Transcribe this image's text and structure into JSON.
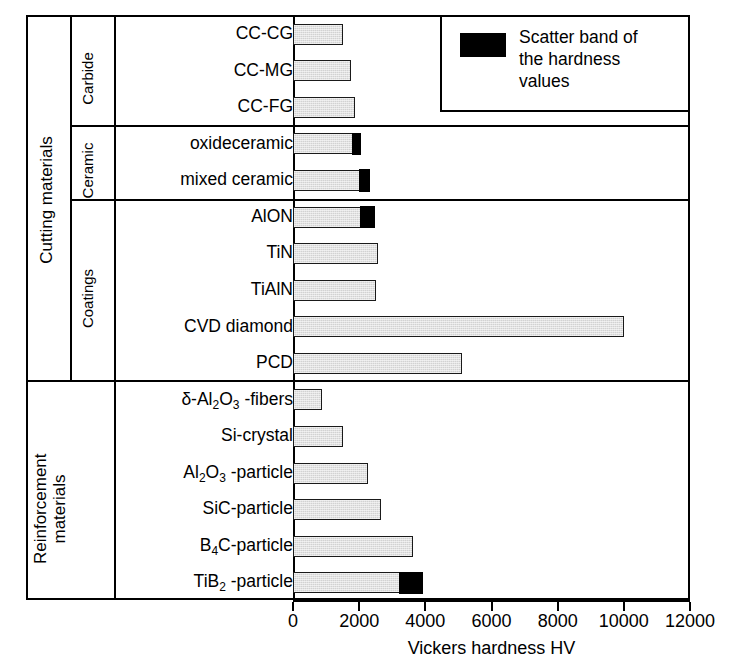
{
  "chart_data": {
    "type": "bar",
    "orientation": "horizontal",
    "title": "",
    "xlabel": "Vickers hardness HV",
    "ylabel": "",
    "xlim": [
      0,
      12000
    ],
    "xticks": [
      0,
      2000,
      4000,
      6000,
      8000,
      10000,
      12000
    ],
    "grid": false,
    "legend": {
      "position": "top-right",
      "entries": [
        {
          "label": "Scatter band of the hardness values",
          "color": "#000000",
          "swatch": "black-rectangle"
        }
      ]
    },
    "series_colors": {
      "value": "#d2d2d2",
      "scatter_band": "#000000"
    },
    "groups": [
      {
        "name": "Cutting materials",
        "subgroups": [
          {
            "name": "Carbide",
            "categories": [
              "CC-CG",
              "CC-MG",
              "CC-FG"
            ],
            "values": [
              1500,
              1740,
              1860
            ],
            "scatter_high": [
              1500,
              1740,
              1860
            ]
          },
          {
            "name": "Ceramic",
            "categories": [
              "oxideceramic",
              "mixed ceramic"
            ],
            "values": [
              1770,
              1980
            ],
            "scatter_high": [
              2040,
              2310
            ]
          },
          {
            "name": "Coatings",
            "categories": [
              "AlON",
              "TiN",
              "TiAlN",
              "CVD diamond",
              "PCD"
            ],
            "values": [
              2010,
              2580,
              2520,
              10020,
              5100
            ],
            "scatter_high": [
              2460,
              2580,
              2520,
              10020,
              5100
            ]
          }
        ]
      },
      {
        "name": "Reinforcement materials",
        "subgroups": [
          {
            "name": "",
            "categories": [
              "δ-Al2O3 -fibers",
              "Si-crystal",
              "Al2O3 -particle",
              "SiC-particle",
              "B4C-particle",
              "TiB2 -particle"
            ],
            "values": [
              870,
              1500,
              2280,
              2670,
              3630,
              3180
            ],
            "scatter_high": [
              870,
              1500,
              2280,
              2670,
              3630,
              3900
            ]
          }
        ]
      }
    ],
    "rows": [
      {
        "label_html": "CC-CG",
        "group": "Cutting materials",
        "subgroup": "Carbide",
        "value": 1500,
        "scatter_high": 1500
      },
      {
        "label_html": "CC-MG",
        "group": "Cutting materials",
        "subgroup": "Carbide",
        "value": 1740,
        "scatter_high": 1740
      },
      {
        "label_html": "CC-FG",
        "group": "Cutting materials",
        "subgroup": "Carbide",
        "value": 1860,
        "scatter_high": 1860
      },
      {
        "label_html": "oxideceramic",
        "group": "Cutting materials",
        "subgroup": "Ceramic",
        "value": 1770,
        "scatter_high": 2040
      },
      {
        "label_html": "mixed ceramic",
        "group": "Cutting materials",
        "subgroup": "Ceramic",
        "value": 1980,
        "scatter_high": 2310
      },
      {
        "label_html": "AlON",
        "group": "Cutting materials",
        "subgroup": "Coatings",
        "value": 2010,
        "scatter_high": 2460
      },
      {
        "label_html": "TiN",
        "group": "Cutting materials",
        "subgroup": "Coatings",
        "value": 2580,
        "scatter_high": 2580
      },
      {
        "label_html": "TiAlN",
        "group": "Cutting materials",
        "subgroup": "Coatings",
        "value": 2520,
        "scatter_high": 2520
      },
      {
        "label_html": "CVD diamond",
        "group": "Cutting materials",
        "subgroup": "Coatings",
        "value": 10020,
        "scatter_high": 10020
      },
      {
        "label_html": "PCD",
        "group": "Cutting materials",
        "subgroup": "Coatings",
        "value": 5100,
        "scatter_high": 5100
      },
      {
        "label_html": "δ-Al<sub>2</sub>O<sub>3</sub> -fibers",
        "group": "Reinforcement materials",
        "subgroup": "",
        "value": 870,
        "scatter_high": 870
      },
      {
        "label_html": "Si-crystal",
        "group": "Reinforcement materials",
        "subgroup": "",
        "value": 1500,
        "scatter_high": 1500
      },
      {
        "label_html": "Al<sub>2</sub>O<sub>3</sub> -particle",
        "group": "Reinforcement materials",
        "subgroup": "",
        "value": 2280,
        "scatter_high": 2280
      },
      {
        "label_html": "SiC-particle",
        "group": "Reinforcement materials",
        "subgroup": "",
        "value": 2670,
        "scatter_high": 2670
      },
      {
        "label_html": "B<sub>4</sub>C-particle",
        "group": "Reinforcement materials",
        "subgroup": "",
        "value": 3630,
        "scatter_high": 3630
      },
      {
        "label_html": "TiB<sub>2</sub> -particle",
        "group": "Reinforcement materials",
        "subgroup": "",
        "value": 3180,
        "scatter_high": 3900
      }
    ]
  },
  "axis": {
    "tick_labels": [
      "0",
      "2000",
      "4000",
      "6000",
      "8000",
      "10000",
      "12000"
    ],
    "title": "Vickers hardness HV"
  },
  "legend": {
    "line1": "Scatter band of",
    "line2": "the hardness",
    "line3": "values"
  },
  "groups": {
    "cutting_materials": "Cutting materials",
    "reinforcement_materials_line1": "Reinforcement",
    "reinforcement_materials_line2": "materials",
    "carbide": "Carbide",
    "ceramic": "Ceramic",
    "coatings": "Coatings"
  }
}
